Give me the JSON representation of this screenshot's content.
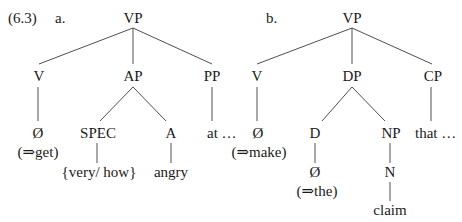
{
  "example_label": "(6.3)",
  "trees": [
    {
      "label": "a.",
      "root": "VP",
      "level1": [
        "V",
        "AP",
        "PP"
      ],
      "v_child": "Ø",
      "v_gloss": "(⇒get)",
      "ap_children": [
        "SPEC",
        "A"
      ],
      "pp_child": "at …",
      "spec_child": "{very/ how}",
      "a_child": "angry"
    },
    {
      "label": "b.",
      "root": "VP",
      "level1": [
        "V",
        "DP",
        "CP"
      ],
      "v_child": "Ø",
      "v_gloss": "(⇒make)",
      "dp_children": [
        "D",
        "NP"
      ],
      "cp_child": "that …",
      "d_child": "Ø",
      "d_gloss": "(⇒the)",
      "np_child": "N",
      "n_child": "claim"
    }
  ]
}
